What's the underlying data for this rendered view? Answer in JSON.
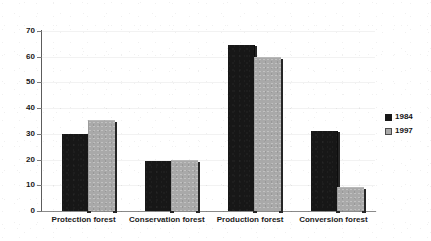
{
  "chart_data": {
    "type": "bar",
    "title": "",
    "subtitle": "",
    "xlabel": "",
    "ylabel": "",
    "categories": [
      "Protection forest",
      "Conservation forest",
      "Production forest",
      "Conversion forest"
    ],
    "series": [
      {
        "name": "1984",
        "color": "#171717",
        "values": [
          30,
          19.5,
          64.5,
          31
        ]
      },
      {
        "name": "1997",
        "color": "#a9a9a9",
        "values": [
          35,
          19.5,
          59.5,
          8.8
        ]
      }
    ],
    "ylim": [
      0,
      70
    ],
    "yticks": [
      0,
      10,
      20,
      30,
      40,
      50,
      60,
      70
    ],
    "ytick_labels": [
      "0",
      "10",
      "20",
      "30",
      "40",
      "50",
      "60",
      "70"
    ],
    "grid": false,
    "legend_position": "right",
    "legend_entries": [
      "1984",
      "1997"
    ]
  },
  "axis": {
    "y_labels": [
      "70",
      "60",
      "50",
      "40",
      "30",
      "20",
      "10",
      "0"
    ]
  },
  "legend": {
    "items": [
      {
        "label": "1984",
        "swatch": "dark-square-icon"
      },
      {
        "label": "1997",
        "swatch": "light-square-icon"
      }
    ]
  }
}
